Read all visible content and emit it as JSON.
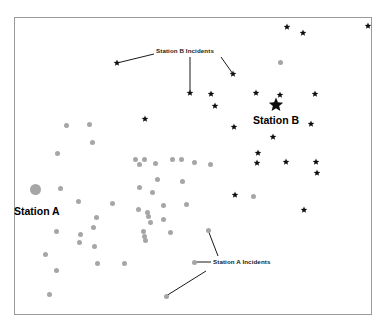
{
  "figure": {
    "title": "",
    "frame": {
      "x": 14,
      "y": 17,
      "width": 358,
      "height": 298,
      "border_color": "#9a9a9a"
    },
    "background": "#ffffff"
  },
  "labels": {
    "station_a": "Station A",
    "station_b": "Station B",
    "station_a_incidents": "Station A Incidents",
    "station_b_incidents": "Station B Incidents"
  },
  "colors": {
    "station_a_marker": "#a6a6a6",
    "station_b_marker": "#0d0d0d",
    "incident_a": "#a6a6a6",
    "incident_b": "#0d0d0d",
    "leader_line": "#1a1a1a",
    "frame": "#9a9a9a"
  },
  "chart_data": {
    "type": "scatter",
    "title": "",
    "xlabel": "",
    "ylabel": "",
    "xlim": [
      0,
      387
    ],
    "ylim": [
      0,
      331
    ],
    "grid": false,
    "legend_position": "none",
    "annotations": [
      {
        "text": "Station B Incidents",
        "x": 156,
        "y": 51,
        "leaders": [
          {
            "x1": 154,
            "y1": 54,
            "x2": 117,
            "y2": 63
          },
          {
            "x1": 190,
            "y1": 57,
            "x2": 190,
            "y2": 91
          },
          {
            "x1": 221,
            "y1": 57,
            "x2": 233,
            "y2": 74
          }
        ]
      },
      {
        "text": "Station A Incidents",
        "x": 213,
        "y": 262,
        "leaders": [
          {
            "x1": 211,
            "y1": 262,
            "x2": 194,
            "y2": 262
          },
          {
            "x1": 218,
            "y1": 256,
            "x2": 208,
            "y2": 230
          },
          {
            "x1": 206,
            "y1": 271,
            "x2": 166,
            "y2": 296
          }
        ]
      },
      {
        "text": "Station A",
        "x": 14,
        "y": 205,
        "kind": "station",
        "leaders": []
      },
      {
        "text": "Station B",
        "x": 253,
        "y": 114,
        "kind": "station",
        "leaders": []
      }
    ],
    "series": [
      {
        "name": "Station A",
        "marker": "circle",
        "color": "#a6a6a6",
        "size": 11,
        "points": [
          {
            "x": 35,
            "y": 189
          }
        ]
      },
      {
        "name": "Station B",
        "marker": "star",
        "color": "#0d0d0d",
        "size": 15,
        "points": [
          {
            "x": 276,
            "y": 105
          }
        ]
      },
      {
        "name": "Station A Incidents",
        "marker": "circle",
        "color": "#a6a6a6",
        "size": 5,
        "points": [
          {
            "x": 66,
            "y": 125
          },
          {
            "x": 89,
            "y": 124
          },
          {
            "x": 92,
            "y": 142
          },
          {
            "x": 57,
            "y": 153
          },
          {
            "x": 60,
            "y": 188
          },
          {
            "x": 78,
            "y": 201
          },
          {
            "x": 112,
            "y": 203
          },
          {
            "x": 96,
            "y": 217
          },
          {
            "x": 93,
            "y": 227
          },
          {
            "x": 94,
            "y": 246
          },
          {
            "x": 97,
            "y": 263
          },
          {
            "x": 124,
            "y": 263
          },
          {
            "x": 80,
            "y": 234
          },
          {
            "x": 79,
            "y": 242
          },
          {
            "x": 56,
            "y": 231
          },
          {
            "x": 45,
            "y": 254
          },
          {
            "x": 56,
            "y": 270
          },
          {
            "x": 49,
            "y": 294
          },
          {
            "x": 144,
            "y": 159
          },
          {
            "x": 139,
            "y": 164
          },
          {
            "x": 155,
            "y": 163
          },
          {
            "x": 172,
            "y": 159
          },
          {
            "x": 181,
            "y": 159
          },
          {
            "x": 157,
            "y": 179
          },
          {
            "x": 194,
            "y": 162
          },
          {
            "x": 210,
            "y": 164
          },
          {
            "x": 139,
            "y": 187
          },
          {
            "x": 138,
            "y": 209
          },
          {
            "x": 147,
            "y": 212
          },
          {
            "x": 152,
            "y": 192
          },
          {
            "x": 148,
            "y": 216
          },
          {
            "x": 150,
            "y": 222
          },
          {
            "x": 143,
            "y": 231
          },
          {
            "x": 144,
            "y": 236
          },
          {
            "x": 145,
            "y": 240
          },
          {
            "x": 163,
            "y": 205
          },
          {
            "x": 163,
            "y": 219
          },
          {
            "x": 170,
            "y": 232
          },
          {
            "x": 186,
            "y": 204
          },
          {
            "x": 182,
            "y": 181
          },
          {
            "x": 208,
            "y": 230
          },
          {
            "x": 194,
            "y": 262
          },
          {
            "x": 166,
            "y": 296
          },
          {
            "x": 253,
            "y": 196
          },
          {
            "x": 280,
            "y": 62
          },
          {
            "x": 135,
            "y": 159
          }
        ]
      },
      {
        "name": "Station B Incidents",
        "marker": "star",
        "color": "#0d0d0d",
        "size": 7,
        "points": [
          {
            "x": 287,
            "y": 27
          },
          {
            "x": 303,
            "y": 33
          },
          {
            "x": 368,
            "y": 26
          },
          {
            "x": 117,
            "y": 63
          },
          {
            "x": 233,
            "y": 74
          },
          {
            "x": 190,
            "y": 93
          },
          {
            "x": 211,
            "y": 94
          },
          {
            "x": 215,
            "y": 106
          },
          {
            "x": 256,
            "y": 93
          },
          {
            "x": 280,
            "y": 95
          },
          {
            "x": 315,
            "y": 94
          },
          {
            "x": 145,
            "y": 119
          },
          {
            "x": 234,
            "y": 127
          },
          {
            "x": 311,
            "y": 124
          },
          {
            "x": 273,
            "y": 137
          },
          {
            "x": 258,
            "y": 153
          },
          {
            "x": 257,
            "y": 163
          },
          {
            "x": 286,
            "y": 162
          },
          {
            "x": 316,
            "y": 162
          },
          {
            "x": 317,
            "y": 173
          },
          {
            "x": 235,
            "y": 195
          },
          {
            "x": 304,
            "y": 210
          }
        ]
      }
    ]
  }
}
